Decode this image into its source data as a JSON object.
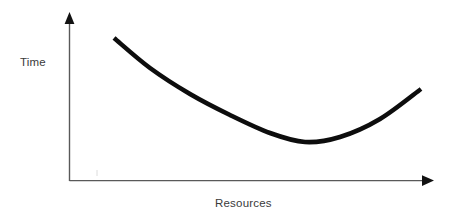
{
  "figure": {
    "background_color": "#ffffff",
    "width": 456,
    "height": 216
  },
  "chart_data": {
    "type": "line",
    "title": "",
    "subtitle": "",
    "xlabel": "Resources",
    "ylabel": "Time",
    "grid": false,
    "legend": null,
    "axis_style": {
      "arrowheads": true,
      "color": "#595959",
      "line_width": 1.4,
      "ticks": false,
      "tick_labels": false
    },
    "series": [
      {
        "name": "Time vs Resources",
        "color": "#0d0d0d",
        "line_width": 4.6,
        "shape": "convex-u-curve",
        "annotation": "Time decreases steeply as resources increase, reaches a minimum, then rises again",
        "points": [
          {
            "x": 114,
            "y": 38
          },
          {
            "x": 150,
            "y": 68
          },
          {
            "x": 190,
            "y": 94
          },
          {
            "x": 230,
            "y": 115
          },
          {
            "x": 270,
            "y": 133
          },
          {
            "x": 305,
            "y": 142
          },
          {
            "x": 340,
            "y": 137
          },
          {
            "x": 380,
            "y": 119
          },
          {
            "x": 421,
            "y": 89
          }
        ]
      }
    ],
    "xlim": [
      69,
      434
    ],
    "ylim": [
      181,
      13
    ],
    "minimum_point": {
      "x": 305,
      "y": 142
    }
  },
  "axes": {
    "y_axis": {
      "name": "vertical-axis",
      "x": 69,
      "y_top": 13,
      "y_bottom": 181
    },
    "x_axis": {
      "name": "horizontal-axis",
      "y": 181,
      "x_left": 69,
      "x_right": 434
    }
  },
  "labels": {
    "y": "Time",
    "x": "Resources"
  }
}
